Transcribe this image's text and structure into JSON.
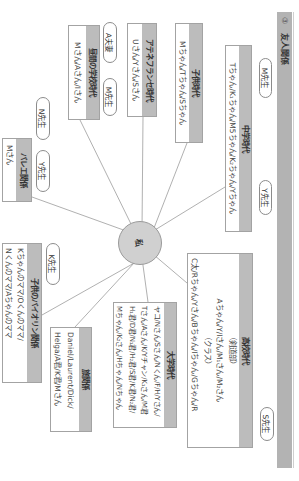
{
  "section": {
    "number": "③",
    "title": "友人関係"
  },
  "center": {
    "label": "私"
  },
  "pills": [
    {
      "label": "M先生"
    },
    {
      "label": "Y先生"
    },
    {
      "label": "S先生"
    },
    {
      "label": "A夫妻"
    },
    {
      "label": "M先生"
    },
    {
      "label": "N先生"
    },
    {
      "label": "Y先生"
    },
    {
      "label": "K先生"
    }
  ],
  "groups": [
    {
      "title": "子供時代",
      "lines": [
        "Mちゃん/Tちゃん/Sちゃん"
      ]
    },
    {
      "title": "中学時代",
      "lines": [
        "Tちゃん/K₁ちゃん/M5ちゃん/K₂ちゃん/Yちゃん"
      ]
    },
    {
      "title": "高校時代",
      "lines": [
        "（剣道部）",
        "Aちゃん/Y/Iさん/M₁さん/M₂さん",
        "（クラス）",
        "C太/Rちゃん/Yさん/Bちゃん/Iちゃん/Gちゃん/R"
      ]
    },
    {
      "title": "アテネフランセ時代",
      "lines": [
        "Uさん/Yさん/Sさん"
      ]
    },
    {
      "title": "昼間の学校時代",
      "lines": [
        "Mさん/Aさん/Iさん"
      ]
    },
    {
      "title": "大学時代",
      "lines": [
        "ヤコ/Nさん/Sさん/Nくん/F/H/Yさん/",
        "Tさん/Aさん/K/Yチャン/K₁さん/M君",
        "H₁君/D君/N₁君/H₂君/S君/K君/N₂君/",
        "Mちゃん/K₂さん/Hちゃん/Nちゃん"
      ]
    },
    {
      "title": "バレエ関係",
      "lines": [
        "Mさん"
      ]
    },
    {
      "title": "旅関係",
      "lines": [
        "Daniel/Laurent/Dick/",
        "Helga/A君/K君/Mさん"
      ]
    },
    {
      "title": "子供のバイオリン関係",
      "lines": [
        "Kちゃんのママ/Oくんのママ/",
        "Nくんのママ/Aちゃんのママ"
      ]
    }
  ]
}
